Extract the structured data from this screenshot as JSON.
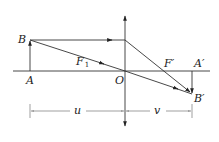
{
  "diagram": {
    "type": "convex-lens-ray-diagram",
    "labels": {
      "object_top": "B",
      "object_base": "A",
      "focus_left": "F",
      "focus_left_sub": "1",
      "optical_center": "O",
      "focus_right": "F′",
      "image_base": "A′",
      "image_top": "B′",
      "object_distance": "u",
      "image_distance": "v"
    },
    "colors": {
      "line": "#333333",
      "dimension": "#777777",
      "background": "#ffffff"
    }
  }
}
